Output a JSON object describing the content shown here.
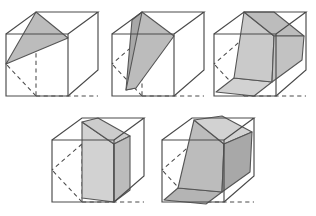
{
  "figure": {
    "caption": "",
    "panel_count": 5,
    "background_color": "#ffffff",
    "edge_color": "#4a4a4a",
    "hidden_edge_style": "dashed",
    "fill_light": "#d2d2d2",
    "fill_mid": "#bcbcbc",
    "fill_dark": "#a8a8a8",
    "face_outline_color": "#555555",
    "projection": "oblique parallel projection",
    "cube_geometry": {
      "front_face_x": 2,
      "front_face_y": 30,
      "front_face_size": 62,
      "depth_dx": 30,
      "depth_dy": -26
    },
    "panels": [
      {
        "id": "cube-1",
        "index": 1,
        "name": "triangle-slice",
        "label": "",
        "position": {
          "left": 4,
          "top": 4
        },
        "shaded_faces": [
          {
            "name": "triangle-face",
            "tone": "mid"
          }
        ]
      },
      {
        "id": "cube-2",
        "index": 2,
        "name": "tilted-quadrilateral-slice",
        "label": "",
        "position": {
          "left": 110,
          "top": 4
        },
        "shaded_faces": [
          {
            "name": "slant-face",
            "tone": "mid"
          },
          {
            "name": "left-sliver-face",
            "tone": "dark"
          }
        ]
      },
      {
        "id": "cube-3",
        "index": 3,
        "name": "wedge-slab",
        "label": "",
        "position": {
          "left": 212,
          "top": 4
        },
        "shaded_faces": [
          {
            "name": "top-face",
            "tone": "mid"
          },
          {
            "name": "front-face",
            "tone": "light"
          },
          {
            "name": "bottom-face",
            "tone": "light"
          }
        ]
      },
      {
        "id": "cube-4",
        "index": 4,
        "name": "upright-slab",
        "label": "",
        "position": {
          "left": 50,
          "top": 110
        },
        "shaded_faces": [
          {
            "name": "top-face",
            "tone": "light"
          },
          {
            "name": "front-face",
            "tone": "light"
          },
          {
            "name": "right-face",
            "tone": "mid"
          }
        ]
      },
      {
        "id": "cube-5",
        "index": 5,
        "name": "large-oblique-prism",
        "label": "",
        "position": {
          "left": 160,
          "top": 110
        },
        "shaded_faces": [
          {
            "name": "top-face",
            "tone": "light"
          },
          {
            "name": "front-face",
            "tone": "mid"
          },
          {
            "name": "right-face",
            "tone": "dark"
          },
          {
            "name": "bottom-face",
            "tone": "mid"
          }
        ]
      }
    ]
  }
}
